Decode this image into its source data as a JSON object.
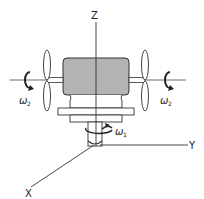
{
  "diagram": {
    "axes": {
      "z_label": "Z",
      "y_label": "Y",
      "x_label": "X"
    },
    "rotations": {
      "left_propeller": "ω",
      "left_propeller_sub": "2",
      "right_propeller": "ω",
      "right_propeller_sub": "2",
      "base_shaft": "ω",
      "base_shaft_sub": "1"
    },
    "colors": {
      "line": "#222222",
      "body_fill": "#b3b3b3",
      "background": "#ffffff"
    }
  }
}
